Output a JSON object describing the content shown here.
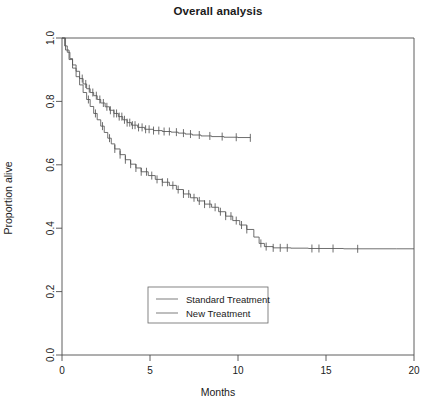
{
  "chart_data": {
    "type": "line",
    "title": "Overall analysis",
    "xlabel": "Months",
    "ylabel": "Proportion alive",
    "xlim": [
      0,
      20
    ],
    "ylim": [
      0.0,
      1.0
    ],
    "xticks": [
      "0",
      "5",
      "10",
      "15",
      "20"
    ],
    "xtick_values": [
      0,
      5,
      10,
      15,
      20
    ],
    "yticks": [
      "0.0",
      "0.2",
      "0.4",
      "0.6",
      "0.8",
      "1.0"
    ],
    "ytick_values": [
      0.0,
      0.2,
      0.4,
      0.6,
      0.8,
      1.0
    ],
    "grid": false,
    "legend_position": "bottom-center",
    "plot_style": "kaplan-meier-step",
    "series": [
      {
        "name": "Standard Treatment",
        "color": "#555555",
        "points": [
          [
            0.0,
            1.0
          ],
          [
            0.15,
            0.975
          ],
          [
            0.3,
            0.955
          ],
          [
            0.45,
            0.935
          ],
          [
            0.6,
            0.915
          ],
          [
            0.8,
            0.895
          ],
          [
            1.0,
            0.872
          ],
          [
            1.2,
            0.855
          ],
          [
            1.4,
            0.84
          ],
          [
            1.6,
            0.828
          ],
          [
            1.8,
            0.818
          ],
          [
            2.0,
            0.806
          ],
          [
            2.2,
            0.795
          ],
          [
            2.45,
            0.783
          ],
          [
            2.7,
            0.772
          ],
          [
            2.95,
            0.762
          ],
          [
            3.2,
            0.752
          ],
          [
            3.45,
            0.742
          ],
          [
            3.7,
            0.733
          ],
          [
            3.95,
            0.725
          ],
          [
            4.3,
            0.718
          ],
          [
            4.7,
            0.712
          ],
          [
            5.2,
            0.708
          ],
          [
            5.7,
            0.705
          ],
          [
            6.2,
            0.703
          ],
          [
            6.6,
            0.7
          ],
          [
            7.0,
            0.697
          ],
          [
            7.4,
            0.694
          ],
          [
            7.9,
            0.691
          ],
          [
            8.5,
            0.689
          ],
          [
            9.2,
            0.687
          ],
          [
            10.0,
            0.686
          ],
          [
            10.7,
            0.685
          ]
        ],
        "censor_times": [
          1.15,
          1.35,
          1.55,
          1.75,
          1.95,
          2.15,
          2.35,
          2.55,
          2.75,
          2.95,
          3.1,
          3.25,
          3.4,
          3.55,
          3.7,
          3.85,
          4.0,
          4.15,
          4.35,
          4.55,
          4.75,
          4.95,
          5.2,
          5.5,
          5.8,
          6.1,
          6.5,
          6.9,
          7.3,
          7.8,
          8.4,
          9.1,
          9.9,
          10.7
        ],
        "end_value": 0.685
      },
      {
        "name": "New Treatment",
        "color": "#555555",
        "points": [
          [
            0.0,
            1.0
          ],
          [
            0.2,
            0.962
          ],
          [
            0.4,
            0.932
          ],
          [
            0.6,
            0.905
          ],
          [
            0.8,
            0.878
          ],
          [
            1.0,
            0.852
          ],
          [
            1.2,
            0.828
          ],
          [
            1.4,
            0.806
          ],
          [
            1.6,
            0.784
          ],
          [
            1.8,
            0.762
          ],
          [
            2.0,
            0.742
          ],
          [
            2.2,
            0.722
          ],
          [
            2.4,
            0.702
          ],
          [
            2.6,
            0.684
          ],
          [
            2.8,
            0.666
          ],
          [
            3.0,
            0.65
          ],
          [
            3.3,
            0.632
          ],
          [
            3.6,
            0.616
          ],
          [
            3.9,
            0.602
          ],
          [
            4.2,
            0.59
          ],
          [
            4.5,
            0.578
          ],
          [
            4.9,
            0.566
          ],
          [
            5.3,
            0.554
          ],
          [
            5.7,
            0.545
          ],
          [
            6.1,
            0.535
          ],
          [
            6.5,
            0.522
          ],
          [
            6.9,
            0.508
          ],
          [
            7.3,
            0.496
          ],
          [
            7.7,
            0.486
          ],
          [
            8.1,
            0.476
          ],
          [
            8.5,
            0.466
          ],
          [
            8.9,
            0.452
          ],
          [
            9.3,
            0.438
          ],
          [
            9.7,
            0.424
          ],
          [
            10.1,
            0.41
          ],
          [
            10.5,
            0.396
          ],
          [
            10.9,
            0.372
          ],
          [
            11.2,
            0.352
          ],
          [
            11.5,
            0.342
          ],
          [
            12.0,
            0.338
          ],
          [
            13.0,
            0.337
          ],
          [
            14.0,
            0.336
          ],
          [
            15.0,
            0.336
          ],
          [
            16.0,
            0.335
          ],
          [
            17.5,
            0.335
          ],
          [
            19.0,
            0.335
          ],
          [
            20.0,
            0.335
          ]
        ],
        "censor_times": [
          1.5,
          1.9,
          2.3,
          2.7,
          3.0,
          3.3,
          3.6,
          3.9,
          4.2,
          4.5,
          4.8,
          5.1,
          5.4,
          5.7,
          6.0,
          6.3,
          6.6,
          6.9,
          7.2,
          7.5,
          7.8,
          8.1,
          8.4,
          8.7,
          9.0,
          9.3,
          9.6,
          9.9,
          10.2,
          10.5,
          11.3,
          11.6,
          12.0,
          12.4,
          12.8,
          14.2,
          14.6,
          15.4,
          16.8
        ],
        "end_value": 0.335
      }
    ]
  },
  "legend": {
    "entries": [
      {
        "label": "Standard Treatment"
      },
      {
        "label": "New Treatment"
      }
    ]
  }
}
